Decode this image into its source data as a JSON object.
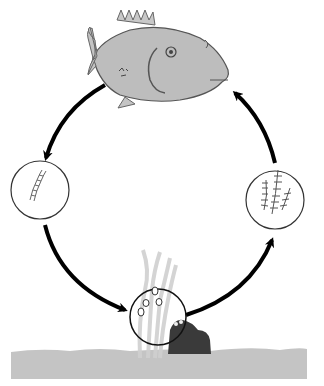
{
  "diagram": {
    "type": "life-cycle",
    "stages": [
      {
        "id": "adult",
        "name": "adult-fish",
        "position": "top"
      },
      {
        "id": "egg-string",
        "name": "larva-stage-circle",
        "position": "left"
      },
      {
        "id": "eggs",
        "name": "eggs-circle",
        "position": "bottom"
      },
      {
        "id": "juveniles",
        "name": "juvenile-stage-circle",
        "position": "right"
      }
    ],
    "flow": [
      "adult",
      "egg-string",
      "eggs",
      "juveniles",
      "adult"
    ],
    "colors": {
      "fish": "#bdbdbd",
      "outline": "#555555",
      "arrow": "#000000",
      "ground": "#c4c4c4",
      "rock": "#3a3a3a",
      "seaweed": "#d8d8d8",
      "background": "#ffffff"
    }
  }
}
